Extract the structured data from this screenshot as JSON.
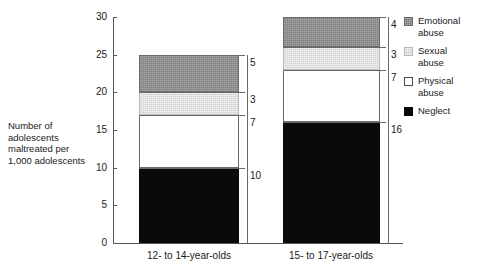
{
  "chart_data": {
    "type": "bar",
    "subtype": "stacked-vertical",
    "title": "",
    "xlabel": "",
    "ylabel": "Number of\nadolescents\nmaltreated per\n1,000 adolescents",
    "categories": [
      "12- to 14-year-olds",
      "15- to 17-year-olds"
    ],
    "series": [
      {
        "name": "Neglect",
        "values": [
          10,
          16
        ],
        "color": "#0a0a0a"
      },
      {
        "name": "Physical abuse",
        "values": [
          7,
          7
        ],
        "color": "#ffffff"
      },
      {
        "name": "Sexual abuse",
        "values": [
          3,
          3
        ],
        "color": "#d2d2d2"
      },
      {
        "name": "Emotional abuse",
        "values": [
          5,
          4
        ],
        "color": "#7f7f7f"
      }
    ],
    "totals": [
      25,
      30
    ],
    "ylim": [
      0,
      30
    ],
    "yticks": [
      0,
      5,
      10,
      15,
      20,
      25,
      30
    ],
    "ytick_labels": [
      "0",
      "5",
      "10",
      "15",
      "20",
      "25",
      "30"
    ],
    "grid": false,
    "legend_position": "right",
    "data_labels": {
      "bar_1": {
        "neglect": "10",
        "physical": "7",
        "sexual": "3",
        "emotional": "5"
      },
      "bar_2": {
        "neglect": "16",
        "physical": "7",
        "sexual": "3",
        "emotional": "4"
      }
    }
  },
  "axes": {
    "y_label_text": "Number of\nadolescents\nmaltreated per\n1,000 adolescents",
    "y_ticks": [
      {
        "value": 30,
        "label": "30"
      },
      {
        "value": 25,
        "label": "25"
      },
      {
        "value": 20,
        "label": "20"
      },
      {
        "value": 15,
        "label": "15"
      },
      {
        "value": 10,
        "label": "10"
      },
      {
        "value": 5,
        "label": "5"
      },
      {
        "value": 0,
        "label": "0"
      }
    ],
    "x_categories": [
      {
        "label": "12- to 14-year-olds"
      },
      {
        "label": "15- to 17-year-olds"
      }
    ]
  },
  "legend": {
    "items": [
      {
        "label": "Emotional\nabuse",
        "key": "emotional"
      },
      {
        "label": "Sexual\nabuse",
        "key": "sexual"
      },
      {
        "label": "Physical\nabuse",
        "key": "physical"
      },
      {
        "label": "Neglect",
        "key": "neglect"
      }
    ]
  },
  "bars": {
    "bar_1": {
      "category": "12- to 14-year-olds",
      "segments": [
        {
          "name": "emotional",
          "value": 5,
          "label": "5"
        },
        {
          "name": "sexual",
          "value": 3,
          "label": "3"
        },
        {
          "name": "physical",
          "value": 7,
          "label": "7"
        },
        {
          "name": "neglect",
          "value": 10,
          "label": "10"
        }
      ]
    },
    "bar_2": {
      "category": "15- to 17-year-olds",
      "segments": [
        {
          "name": "emotional",
          "value": 4,
          "label": "4"
        },
        {
          "name": "sexual",
          "value": 3,
          "label": "3"
        },
        {
          "name": "physical",
          "value": 7,
          "label": "7"
        },
        {
          "name": "neglect",
          "value": 16,
          "label": "16"
        }
      ]
    }
  }
}
